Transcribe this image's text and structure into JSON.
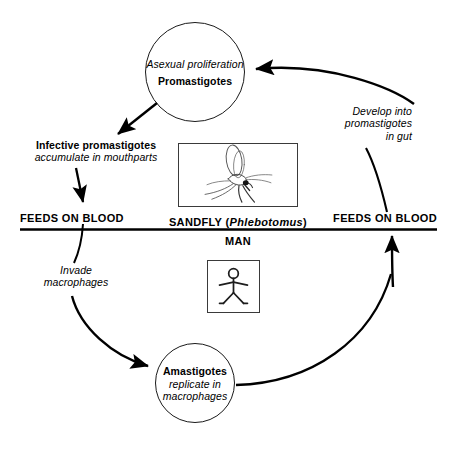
{
  "diagram": {
    "colors": {
      "ink": "#000000",
      "line": "#1a1a1a",
      "background": "#ffffff"
    },
    "nodes": {
      "promastigote": {
        "line1": "Asexual proliferation",
        "line2": "Promastigotes"
      },
      "amastigote": {
        "line1": "Amastigotes",
        "line2": "replicate in",
        "line3": "macrophages"
      }
    },
    "labels": {
      "infective_bold": "Infective promastigotes",
      "infective_italic": "accumulate in mouthparts",
      "feeds_left": "FEEDS ON BLOOD",
      "feeds_right": "FEEDS ON BLOOD",
      "sandfly": "SANDFLY (",
      "sandfly_genus": "Phlebotomus",
      "sandfly_close": ")",
      "man": "MAN",
      "invade_line1": "Invade",
      "invade_line2": "macrophages",
      "develop_line1": "Develop into",
      "develop_line2": "promastigotes",
      "develop_line3": "in gut"
    },
    "images": {
      "sandfly_box": "sandfly-illustration",
      "man_box": "stick-figure-man-illustration"
    }
  }
}
